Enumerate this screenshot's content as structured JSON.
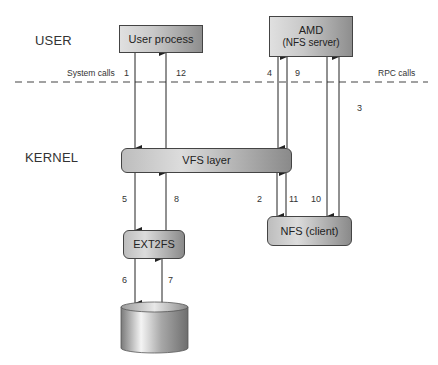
{
  "regions": {
    "user": "USER",
    "kernel": "KERNEL"
  },
  "boundary": {
    "left_label": "System calls",
    "right_label": "RPC calls"
  },
  "nodes": {
    "user_process": {
      "label": "User process"
    },
    "amd": {
      "label": "AMD",
      "sublabel": "(NFS server)"
    },
    "vfs": {
      "label": "VFS layer"
    },
    "ext2fs": {
      "label": "EXT2FS"
    },
    "nfs_client": {
      "label": "NFS (client)"
    },
    "disk": {
      "label": ""
    }
  },
  "edges": [
    {
      "step": "1",
      "from": "User process",
      "to": "VFS layer"
    },
    {
      "step": "2",
      "from": "VFS layer",
      "to": "NFS (client)"
    },
    {
      "step": "3",
      "from": "NFS (client)",
      "to": "AMD"
    },
    {
      "step": "4",
      "from": "AMD",
      "to": "VFS layer"
    },
    {
      "step": "5",
      "from": "VFS layer",
      "to": "EXT2FS"
    },
    {
      "step": "6",
      "from": "EXT2FS",
      "to": "disk"
    },
    {
      "step": "7",
      "from": "disk",
      "to": "EXT2FS"
    },
    {
      "step": "8",
      "from": "EXT2FS",
      "to": "VFS layer"
    },
    {
      "step": "9",
      "from": "VFS layer",
      "to": "AMD"
    },
    {
      "step": "10",
      "from": "AMD",
      "to": "NFS (client)"
    },
    {
      "step": "11",
      "from": "NFS (client)",
      "to": "VFS layer"
    },
    {
      "step": "12",
      "from": "VFS layer",
      "to": "User process"
    }
  ]
}
